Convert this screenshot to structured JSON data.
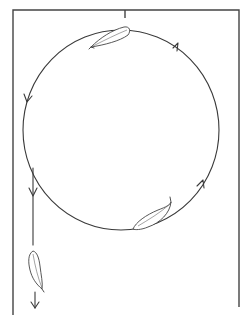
{
  "diagram": {
    "title": "Orbit of a drifting leaf within a frame",
    "description": "Line-art figure: a rectangular open-bottom frame with a central tick at the top; a large circular path with directional arrowheads traversed counter-clockwise; two leaf-like objects riding on the circle (top and bottom-right); a vertical exit line on the left descending from the circle to a third leaf and a downward arrow.",
    "colors": {
      "ink": "#3a3a3a",
      "background": "#ffffff"
    },
    "frame": {
      "left_x": 13,
      "right_x": 239,
      "top_y": 10,
      "left_bottom_y": 315,
      "right_bottom_y": 307,
      "tick_x": 125
    },
    "circle": {
      "cx": 121,
      "cy": 130,
      "rx": 98,
      "ry": 100,
      "direction": "counter-clockwise"
    },
    "arrows": [
      {
        "name": "arrow-top-right",
        "position": "upper right of circle",
        "direction": "toward top"
      },
      {
        "name": "arrow-left",
        "position": "left of circle",
        "direction": "downward"
      },
      {
        "name": "arrow-bottom-right",
        "position": "lower right of circle",
        "direction": "upward"
      },
      {
        "name": "arrow-exit-line",
        "position": "vertical exit line",
        "direction": "downward"
      },
      {
        "name": "arrow-bottom",
        "position": "below falling leaf",
        "direction": "downward"
      }
    ],
    "objects": [
      {
        "name": "leaf-top",
        "icon": "leaf-icon",
        "position": "top of circle"
      },
      {
        "name": "leaf-bottom-right",
        "icon": "leaf-icon",
        "position": "bottom-right of circle"
      },
      {
        "name": "leaf-falling",
        "icon": "leaf-icon",
        "position": "on exit line, lower left"
      }
    ]
  }
}
